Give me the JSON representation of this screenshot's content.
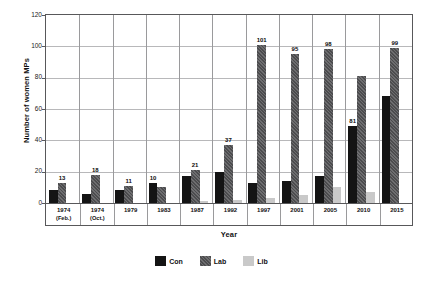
{
  "chart_data": {
    "type": "bar",
    "title": "",
    "subtitle": "",
    "xlabel": "Year",
    "ylabel": "Number of women MPs",
    "ylim": [
      0,
      120
    ],
    "yticks": [
      0,
      20,
      40,
      60,
      80,
      100,
      120
    ],
    "grid": true,
    "legend_position": "bottom-center",
    "categories": [
      "1974 (Feb.)",
      "1974 (Oct.)",
      "1979",
      "1983",
      "1987",
      "1992",
      "1997",
      "2001",
      "2005",
      "2010",
      "2015"
    ],
    "category_lines": [
      {
        "year": "1974",
        "sub": "(Feb.)"
      },
      {
        "year": "1974",
        "sub": "(Oct.)"
      },
      {
        "year": "1979",
        "sub": ""
      },
      {
        "year": "1983",
        "sub": ""
      },
      {
        "year": "1987",
        "sub": ""
      },
      {
        "year": "1992",
        "sub": ""
      },
      {
        "year": "1997",
        "sub": ""
      },
      {
        "year": "2001",
        "sub": ""
      },
      {
        "year": "2005",
        "sub": ""
      },
      {
        "year": "2010",
        "sub": ""
      },
      {
        "year": "2015",
        "sub": ""
      }
    ],
    "series": [
      {
        "name": "Con",
        "color": "#141414",
        "values": [
          8,
          6,
          8,
          13,
          17,
          20,
          13,
          14,
          17,
          49,
          68
        ],
        "labels": [
          "",
          "",
          "",
          "10",
          "",
          "",
          "",
          "",
          "",
          "81",
          ""
        ]
      },
      {
        "name": "Lab",
        "color": "#5a5a5c",
        "values": [
          13,
          18,
          11,
          10,
          21,
          37,
          101,
          95,
          98,
          81,
          99
        ],
        "labels": [
          "13",
          "18",
          "11",
          "",
          "21",
          "37",
          "101",
          "95",
          "98",
          "",
          "99"
        ]
      },
      {
        "name": "Lib",
        "color": "#c9c9c9",
        "values": [
          0,
          0,
          0,
          0,
          1,
          2,
          3,
          5,
          10,
          7,
          0
        ],
        "labels": [
          "",
          "",
          "",
          "",
          "",
          "",
          "",
          "",
          "",
          "",
          ""
        ]
      }
    ],
    "annotations": [
      {
        "text": "13",
        "series": "Lab",
        "category": "1974 (Feb.)"
      },
      {
        "text": "18",
        "series": "Lab",
        "category": "1974 (Oct.)"
      },
      {
        "text": "11",
        "series": "Lab",
        "category": "1979"
      },
      {
        "text": "10",
        "series": "Con",
        "category": "1983"
      },
      {
        "text": "21",
        "series": "Lab",
        "category": "1987"
      },
      {
        "text": "37",
        "series": "Lab",
        "category": "1992"
      },
      {
        "text": "101",
        "series": "Lab",
        "category": "1997"
      },
      {
        "text": "95",
        "series": "Lab",
        "category": "2001"
      },
      {
        "text": "98",
        "series": "Lab",
        "category": "2005"
      },
      {
        "text": "81",
        "series": "Con",
        "category": "2010"
      },
      {
        "text": "99",
        "series": "Lab",
        "category": "2015"
      }
    ]
  },
  "legend": {
    "items": [
      {
        "label": "Con",
        "color": "#141414"
      },
      {
        "label": "Lab",
        "color": "#5a5a5c"
      },
      {
        "label": "Lib",
        "color": "#c9c9c9"
      }
    ]
  }
}
